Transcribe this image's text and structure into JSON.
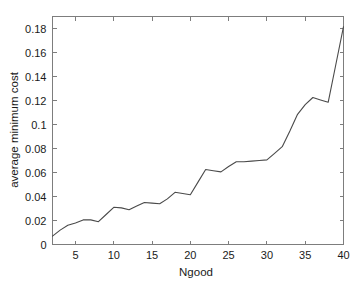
{
  "chart_data": {
    "type": "line",
    "title": "",
    "xlabel": "Ngood",
    "ylabel": "average minimum cost",
    "xlim": [
      2,
      40
    ],
    "ylim": [
      0,
      0.19
    ],
    "grid": false,
    "legend": null,
    "xticks": [
      5,
      10,
      15,
      20,
      25,
      30,
      35,
      40
    ],
    "xtick_labels": [
      "5",
      "10",
      "15",
      "20",
      "25",
      "30",
      "35",
      "40"
    ],
    "yticks": [
      0,
      0.02,
      0.04,
      0.06,
      0.08,
      0.1,
      0.12,
      0.14,
      0.16,
      0.18
    ],
    "ytick_labels": [
      "0",
      "0.02",
      "0.04",
      "0.06",
      "0.08",
      "0.1",
      "0.12",
      "0.14",
      "0.16",
      "0.18"
    ],
    "line_color": "#4a4a4a",
    "x": [
      2,
      3,
      4,
      5,
      6,
      7,
      8,
      9,
      10,
      11,
      12,
      13,
      14,
      15,
      16,
      17,
      18,
      19,
      20,
      21,
      22,
      23,
      24,
      25,
      26,
      27,
      28,
      29,
      30,
      31,
      32,
      33,
      34,
      35,
      36,
      37,
      38,
      39,
      40
    ],
    "values": [
      0.007,
      0.012,
      0.016,
      0.018,
      0.0205,
      0.0205,
      0.019,
      0.025,
      0.031,
      0.0305,
      0.029,
      0.032,
      0.035,
      0.0345,
      0.034,
      0.038,
      0.0435,
      0.0425,
      0.0415,
      0.052,
      0.0625,
      0.0615,
      0.0605,
      0.065,
      0.069,
      0.069,
      0.0695,
      0.07,
      0.0705,
      0.076,
      0.0815,
      0.0945,
      0.1085,
      0.1165,
      0.1225,
      0.1205,
      0.1185,
      0.15,
      0.1815
    ],
    "series": [
      {
        "name": "average minimum cost",
        "values": [
          0.007,
          0.012,
          0.016,
          0.018,
          0.0205,
          0.0205,
          0.019,
          0.025,
          0.031,
          0.0305,
          0.029,
          0.032,
          0.035,
          0.0345,
          0.034,
          0.038,
          0.0435,
          0.0425,
          0.0415,
          0.052,
          0.0625,
          0.0615,
          0.0605,
          0.065,
          0.069,
          0.069,
          0.0695,
          0.07,
          0.0705,
          0.076,
          0.0815,
          0.0945,
          0.1085,
          0.1165,
          0.1225,
          0.1205,
          0.1185,
          0.15,
          0.1815
        ]
      }
    ]
  }
}
